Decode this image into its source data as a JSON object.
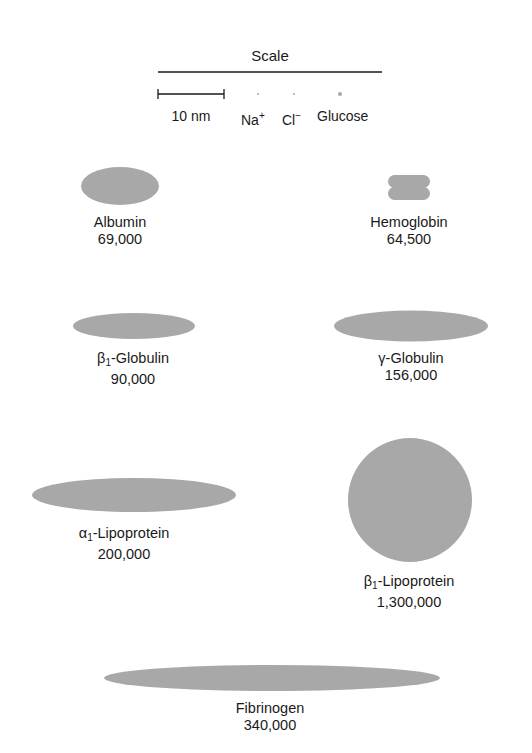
{
  "scale": {
    "title": "Scale",
    "bar_label": "10 nm",
    "ions": [
      {
        "name": "Na",
        "charge": "+"
      },
      {
        "name": "Cl",
        "charge": "−"
      }
    ],
    "glucose_label": "Glucose"
  },
  "colors": {
    "shape_fill": "#a8a8a8",
    "line": "#1a1a1a",
    "text": "#1a1a1a"
  },
  "proteins": [
    {
      "id": "albumin",
      "prefix": "",
      "subscript": "",
      "name": "Albumin",
      "mw": "69,000",
      "shape": "ellipse"
    },
    {
      "id": "hemoglobin",
      "prefix": "",
      "subscript": "",
      "name": "Hemoglobin",
      "mw": "64,500",
      "shape": "double-lobe"
    },
    {
      "id": "beta1-globulin",
      "prefix": "β",
      "subscript": "1",
      "name": "-Globulin",
      "mw": "90,000",
      "shape": "ellipse"
    },
    {
      "id": "gamma-globulin",
      "prefix": "γ",
      "subscript": "",
      "name": "-Globulin",
      "mw": "156,000",
      "shape": "ellipse"
    },
    {
      "id": "alpha1-lipoprotein",
      "prefix": "α",
      "subscript": "1",
      "name": "-Lipoprotein",
      "mw": "200,000",
      "shape": "ellipse"
    },
    {
      "id": "beta1-lipoprotein",
      "prefix": "β",
      "subscript": "1",
      "name": "-Lipoprotein",
      "mw": "1,300,000",
      "shape": "circle"
    },
    {
      "id": "fibrinogen",
      "prefix": "",
      "subscript": "",
      "name": "Fibrinogen",
      "mw": "340,000",
      "shape": "ellipse"
    }
  ]
}
